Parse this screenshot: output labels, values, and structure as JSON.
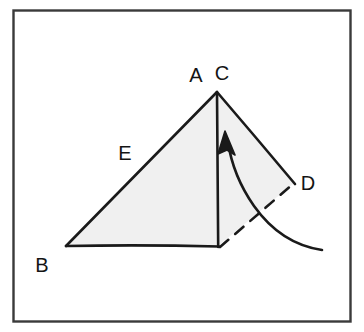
{
  "figure": {
    "background_color": "#ffffff",
    "frame": {
      "stroke_color": "#3a3a3a",
      "x": 13,
      "y": 10,
      "width": 338,
      "height": 312
    },
    "ink_color": "#1a1a1a",
    "fill_color": "#f0f0f0"
  },
  "labels": {
    "a": "A",
    "c": "C",
    "b": "B",
    "d": "D",
    "e": "E"
  },
  "points": {
    "apex": {
      "x": 216,
      "y": 92
    },
    "bottom_left": {
      "x": 66,
      "y": 246
    },
    "foot": {
      "x": 218,
      "y": 246
    },
    "right": {
      "x": 294,
      "y": 183
    }
  },
  "label_positions": {
    "a": {
      "x": 196,
      "y": 82
    },
    "c": {
      "x": 222,
      "y": 80
    },
    "b": {
      "x": 42,
      "y": 272
    },
    "d": {
      "x": 308,
      "y": 190
    },
    "e": {
      "x": 125,
      "y": 160
    }
  },
  "annotations": {
    "rotation_arrow": "curved arrow indicating rotation from D toward C",
    "dashed_segment": "dashed line from foot of altitude to D"
  }
}
